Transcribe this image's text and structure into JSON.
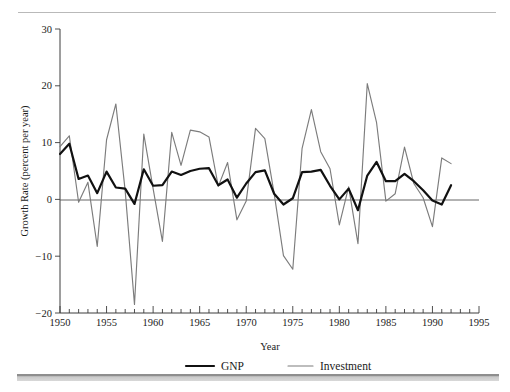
{
  "figure": {
    "top_rule": "decorative-hairline",
    "bottom_bar": "decorative-gray-bar"
  },
  "chart_data": {
    "type": "line",
    "title": "",
    "subtitle": "",
    "xlabel": "Year",
    "ylabel": "Growth Rate (percent per year)",
    "xlim": [
      1950,
      1995
    ],
    "ylim": [
      -20,
      30
    ],
    "grid": false,
    "legend_position": "bottom",
    "x_major_ticks": [
      1950,
      1955,
      1960,
      1965,
      1970,
      1975,
      1980,
      1985,
      1990,
      1995
    ],
    "x_major_tick_labels": [
      "1950",
      "1955",
      "1960",
      "1965",
      "1970",
      "1975",
      "1980",
      "1985",
      "1990",
      "1995"
    ],
    "x_minor_tick_step": 1,
    "y_ticks": [
      -20,
      -10,
      0,
      10,
      20,
      30
    ],
    "y_tick_labels": [
      "−20",
      "−10",
      "0",
      "10",
      "20",
      "30"
    ],
    "zero_reference_line": 0,
    "x": [
      1950,
      1951,
      1952,
      1953,
      1954,
      1955,
      1956,
      1957,
      1958,
      1959,
      1960,
      1961,
      1962,
      1963,
      1964,
      1965,
      1966,
      1967,
      1968,
      1969,
      1970,
      1971,
      1972,
      1973,
      1974,
      1975,
      1976,
      1977,
      1978,
      1979,
      1980,
      1981,
      1982,
      1983,
      1984,
      1985,
      1986,
      1987,
      1988,
      1989,
      1990,
      1991,
      1992
    ],
    "series": [
      {
        "name": "GNP",
        "color": "#111111",
        "style": "thick-black-line",
        "values": [
          8.0,
          9.8,
          3.6,
          4.2,
          1.1,
          4.9,
          2.1,
          1.9,
          -0.8,
          5.3,
          2.4,
          2.5,
          4.9,
          4.3,
          5.0,
          5.4,
          5.5,
          2.5,
          3.5,
          0.3,
          2.8,
          4.8,
          5.1,
          1.0,
          -0.9,
          0.2,
          4.8,
          4.9,
          5.2,
          2.4,
          0.0,
          1.9,
          -1.9,
          4.2,
          6.6,
          3.2,
          3.2,
          4.5,
          3.2,
          1.6,
          -0.2,
          -0.9,
          2.5
        ],
        "ymin": -1.9,
        "ymax": 9.8
      },
      {
        "name": "Investment",
        "color": "#7c7c7c",
        "style": "thin-gray-line",
        "values": [
          9.3,
          11.2,
          -0.5,
          3.0,
          -8.3,
          10.5,
          16.8,
          1.5,
          -18.5,
          11.5,
          1.9,
          -7.4,
          11.8,
          6.0,
          12.2,
          11.9,
          11.0,
          2.3,
          6.5,
          -3.6,
          -0.3,
          12.5,
          10.7,
          1.0,
          -9.9,
          -12.3,
          9.0,
          15.8,
          8.4,
          5.4,
          -4.5,
          2.2,
          -7.8,
          20.4,
          13.5,
          -0.3,
          1.0,
          9.2,
          2.8,
          0.3,
          -4.8,
          7.3,
          6.3
        ],
        "ymin": -18.5,
        "ymax": 20.4
      }
    ]
  },
  "legend": {
    "entries": [
      {
        "label": "GNP",
        "color": "#111111"
      },
      {
        "label": "Investment",
        "color": "#7c7c7c"
      }
    ]
  }
}
